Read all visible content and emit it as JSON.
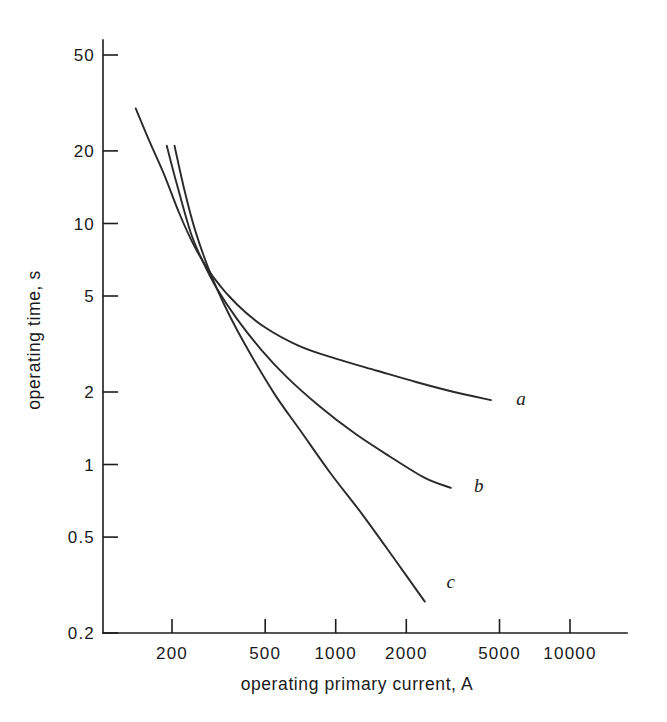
{
  "chart_data": {
    "type": "line",
    "title": "",
    "xlabel": "operating primary current, A",
    "ylabel": "operating time, s",
    "xscale": "log",
    "yscale": "log",
    "xlim": [
      130,
      14000
    ],
    "ylim": [
      0.2,
      60
    ],
    "grid": false,
    "legend_position": "inline-right-of-curve-ends",
    "xticks": [
      200,
      500,
      1000,
      2000,
      5000,
      10000
    ],
    "xtick_labels": [
      "200",
      "500",
      "1000",
      "2000",
      "5000",
      "10000"
    ],
    "yticks": [
      50,
      20,
      10,
      5,
      2,
      1,
      0.5,
      0.2
    ],
    "ytick_labels": [
      "50",
      "20",
      "10",
      "5",
      "2",
      "1",
      "0.5",
      "0.2"
    ],
    "series": [
      {
        "name": "a",
        "label": "a",
        "x": [
          140,
          160,
          185,
          215,
          250,
          300,
          380,
          500,
          700,
          1000,
          1500,
          2200,
          3200,
          4600
        ],
        "y": [
          30.0,
          22.0,
          16.0,
          11.0,
          8.0,
          6.0,
          4.6,
          3.7,
          3.1,
          2.75,
          2.45,
          2.2,
          2.0,
          1.85
        ]
      },
      {
        "name": "b",
        "label": "b",
        "x": [
          190,
          210,
          240,
          270,
          310,
          380,
          480,
          620,
          850,
          1200,
          1700,
          2400,
          3100
        ],
        "y": [
          21.0,
          14.5,
          9.2,
          7.0,
          5.4,
          4.0,
          3.0,
          2.3,
          1.75,
          1.35,
          1.08,
          0.88,
          0.8
        ]
      },
      {
        "name": "c",
        "label": "c",
        "x": [
          205,
          225,
          250,
          290,
          350,
          430,
          550,
          700,
          950,
          1300,
          1800,
          2400
        ],
        "y": [
          21.0,
          14.0,
          9.5,
          6.3,
          4.2,
          2.9,
          1.95,
          1.4,
          0.92,
          0.62,
          0.4,
          0.27
        ]
      }
    ]
  },
  "axes": {
    "x_label": "operating primary current, A",
    "y_label": "operating time, s"
  },
  "curve_labels": {
    "a": "a",
    "b": "b",
    "c": "c"
  },
  "colors": {
    "curve": "#2a2a2a",
    "axis": "#1c1c1c",
    "background": "#ffffff",
    "text": "#1a1a1a"
  }
}
